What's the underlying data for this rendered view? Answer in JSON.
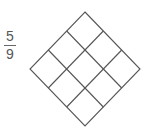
{
  "fraction": {
    "numerator": "5",
    "denominator": "9"
  },
  "diagram": {
    "type": "3x3 grid rotated 45 degrees",
    "rows": 3,
    "cols": 3,
    "shaded_cells": 0,
    "stroke_color": "#555555"
  }
}
